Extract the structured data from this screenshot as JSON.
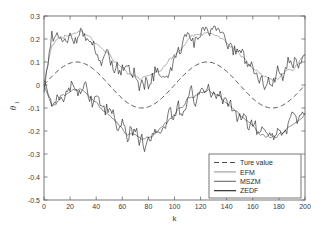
{
  "chart_data": {
    "type": "line",
    "title": "",
    "xlabel": "k",
    "ylabel": "θ₁",
    "ylabel_base": "θ",
    "ylabel_subscript": "1",
    "xlim": [
      0,
      200
    ],
    "ylim": [
      -0.5,
      0.3
    ],
    "xticks": [
      0,
      20,
      40,
      60,
      80,
      100,
      120,
      140,
      160,
      180,
      200
    ],
    "xtick_labels": [
      "0",
      "20",
      "40",
      "60",
      "80",
      "100",
      "120",
      "140",
      "160",
      "180",
      "200"
    ],
    "yticks": [
      -0.5,
      -0.4,
      -0.3,
      -0.2,
      -0.1,
      0,
      0.1,
      0.2,
      0.3
    ],
    "ytick_labels": [
      "-0.5",
      "-0.4",
      "-0.3",
      "-0.2",
      "-0.1",
      "0",
      "0.1",
      "0.2",
      "0.3"
    ],
    "grid": false,
    "legend_position": "lower-right",
    "legend_entries": [
      {
        "label": "Ture value",
        "style": "dashed",
        "color": "#4a4a4a"
      },
      {
        "label": "EFM",
        "style": "solid",
        "color": "#9a9a9a"
      },
      {
        "label": "MSZM",
        "style": "solid",
        "color": "#6a6a6a"
      },
      {
        "label": "ZEDF",
        "style": "solid",
        "color": "#1a1a1a"
      }
    ],
    "series": [
      {
        "name": "Ture value",
        "style": "dashed",
        "color": "#4a4a4a",
        "model": "sine",
        "amplitude": 0.1,
        "period": 100,
        "phase_peak_k": 25,
        "offset": 0.0,
        "x": [
          0,
          10,
          20,
          25,
          30,
          40,
          50,
          60,
          70,
          75,
          80,
          90,
          100,
          110,
          120,
          125,
          130,
          140,
          150,
          160,
          170,
          175,
          180,
          190,
          200
        ],
        "values": [
          0.0,
          0.081,
          0.099,
          0.1,
          0.099,
          0.081,
          0.0,
          -0.081,
          -0.099,
          -0.1,
          -0.099,
          -0.081,
          0.0,
          0.081,
          0.099,
          0.1,
          0.099,
          0.081,
          0.0,
          -0.081,
          -0.099,
          -0.1,
          -0.099,
          -0.081,
          0.0
        ]
      },
      {
        "name": "EFM",
        "style": "solid",
        "color": "#9a9a9a",
        "band": "upper",
        "offset": 0.13,
        "noise_sigma": 0.022,
        "x": [
          0,
          10,
          20,
          25,
          30,
          40,
          50,
          60,
          70,
          75,
          80,
          90,
          100,
          110,
          120,
          125,
          130,
          140,
          150,
          160,
          170,
          175,
          180,
          190,
          200
        ],
        "values": [
          0.105,
          0.19,
          0.225,
          0.232,
          0.238,
          0.205,
          0.145,
          0.085,
          0.045,
          0.035,
          0.03,
          0.06,
          0.135,
          0.2,
          0.225,
          0.228,
          0.222,
          0.19,
          0.135,
          0.085,
          0.055,
          0.05,
          0.05,
          0.08,
          0.12
        ]
      },
      {
        "name": "MSZM",
        "style": "solid",
        "color": "#6a6a6a",
        "band": "lower",
        "offset": -0.13,
        "noise_sigma": 0.02,
        "x": [
          0,
          10,
          20,
          25,
          30,
          40,
          50,
          60,
          70,
          75,
          80,
          90,
          100,
          110,
          120,
          125,
          130,
          140,
          150,
          160,
          170,
          175,
          180,
          190,
          200
        ],
        "values": [
          -0.062,
          -0.028,
          -0.012,
          -0.01,
          -0.018,
          -0.055,
          -0.115,
          -0.175,
          -0.225,
          -0.245,
          -0.255,
          -0.235,
          -0.17,
          -0.105,
          -0.068,
          -0.06,
          -0.058,
          -0.065,
          -0.105,
          -0.16,
          -0.195,
          -0.2,
          -0.2,
          -0.185,
          -0.155
        ]
      },
      {
        "name": "ZEDF",
        "style": "solid",
        "color": "#1a1a1a",
        "band": "both",
        "noise_sigma": 0.032,
        "x": [
          0,
          10,
          20,
          25,
          30,
          40,
          50,
          60,
          70,
          75,
          80,
          90,
          100,
          110,
          120,
          125,
          130,
          140,
          150,
          160,
          170,
          175,
          180,
          190,
          200
        ],
        "values_upper": [
          0.13,
          0.2,
          0.228,
          0.24,
          0.262,
          0.21,
          0.15,
          0.08,
          0.04,
          0.03,
          0.035,
          0.07,
          0.15,
          0.21,
          0.238,
          0.265,
          0.235,
          0.195,
          0.13,
          0.08,
          0.05,
          0.045,
          0.05,
          0.085,
          0.135
        ],
        "values_lower": [
          -0.06,
          -0.02,
          -0.005,
          0.0,
          -0.015,
          -0.06,
          -0.12,
          -0.19,
          -0.24,
          -0.27,
          -0.265,
          -0.24,
          -0.175,
          -0.1,
          -0.06,
          -0.05,
          -0.055,
          -0.07,
          -0.115,
          -0.17,
          -0.205,
          -0.21,
          -0.205,
          -0.19,
          -0.155
        ]
      }
    ]
  }
}
